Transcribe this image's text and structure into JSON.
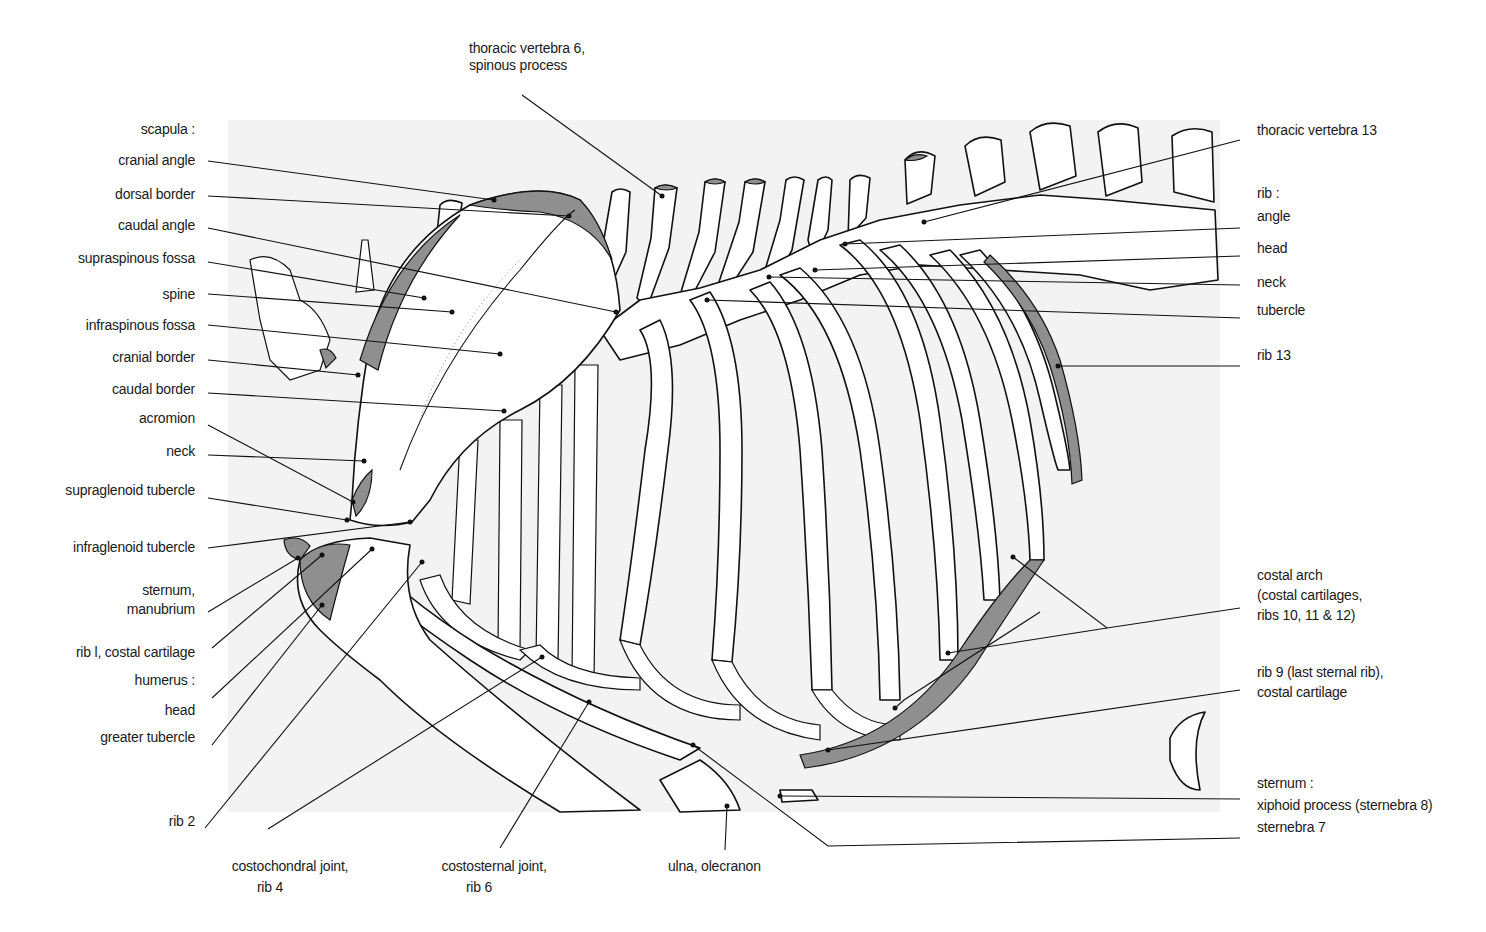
{
  "figure": {
    "background_panel_color": "#f3f3f3",
    "cartilage_shade_color": "#8f8f8f",
    "line_color": "#111111"
  },
  "labels": {
    "top": {
      "thoracic_vertebra_6_line1": "thoracic vertebra 6,",
      "thoracic_vertebra_6_line2": "spinous process"
    },
    "left": {
      "scapula_heading": "scapula :",
      "cranial_angle": "cranial angle",
      "dorsal_border": "dorsal border",
      "caudal_angle": "caudal angle",
      "supraspinous_fossa": "supraspinous fossa",
      "spine": "spine",
      "infraspinous_fossa": "infraspinous fossa",
      "cranial_border": "cranial border",
      "caudal_border": "caudal border",
      "acromion": "acromion",
      "neck": "neck",
      "supraglenoid_tubercle": "supraglenoid tubercle",
      "infraglenoid_tubercle": "infraglenoid tubercle",
      "sternum_line1": "sternum,",
      "sternum_line2": "manubrium",
      "rib1_costal_cartilage": "rib l, costal cartilage",
      "humerus_heading": "humerus :",
      "humerus_head": "head",
      "greater_tubercle": "greater tubercle",
      "rib2": "rib 2"
    },
    "bottom": {
      "costochondral_line1": "costochondral joint,",
      "costochondral_line2": "rib 4",
      "costosternal_line1": "costosternal joint,",
      "costosternal_line2": "rib 6",
      "ulna_olecranon": "ulna, olecranon"
    },
    "right": {
      "thoracic_vertebra_13": "thoracic vertebra 13",
      "rib_heading": "rib :",
      "rib_angle": "angle",
      "rib_head": "head",
      "rib_neck": "neck",
      "rib_tubercle": "tubercle",
      "rib13": "rib 13",
      "costal_arch_line1": "costal arch",
      "costal_arch_line2": "(costal cartilages,",
      "costal_arch_line3": "ribs 10, 11 & 12)",
      "rib9_line1": "rib 9 (last sternal rib),",
      "rib9_line2": "costal cartilage",
      "sternum_heading": "sternum :",
      "xiphoid_process": "xiphoid process (sternebra 8)",
      "sternebra7": "sternebra 7"
    }
  }
}
